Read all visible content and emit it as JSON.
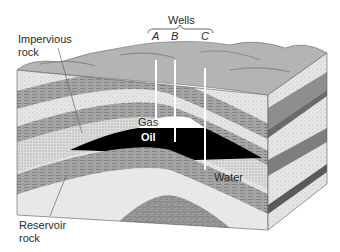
{
  "figure": {
    "wells": {
      "heading": "Wells",
      "items": [
        {
          "id": "A",
          "label": "A"
        },
        {
          "id": "B",
          "label": "B"
        },
        {
          "id": "C",
          "label": "C"
        }
      ]
    },
    "labels": {
      "impervious_rock": [
        "Impervious",
        "rock"
      ],
      "reservoir_rock": [
        "Reservoir",
        "rock"
      ],
      "gas": "Gas",
      "oil": "Oil",
      "water": "Water"
    },
    "colors": {
      "oil": "#000000",
      "gas": "#ffffff",
      "sandstone": "#e4e4e4",
      "shale": "#9a9a9a",
      "surface": "#b8b8b8",
      "label_text": "#2a2a2a"
    }
  }
}
